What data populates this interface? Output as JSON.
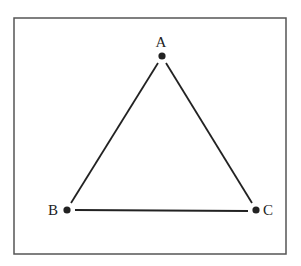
{
  "diagram": {
    "type": "triangle",
    "frame": {
      "x": 14,
      "y": 18,
      "width": 272,
      "height": 236,
      "stroke": "#555555"
    },
    "line_color": "#222222",
    "vertices": [
      {
        "id": "A",
        "label": "A",
        "x": 162,
        "y": 56,
        "label_x": 161,
        "label_y": 47,
        "anchor": "middle"
      },
      {
        "id": "B",
        "label": "B",
        "x": 67,
        "y": 210,
        "label_x": 58,
        "label_y": 215,
        "anchor": "end"
      },
      {
        "id": "C",
        "label": "C",
        "x": 256,
        "y": 210,
        "label_x": 263,
        "label_y": 215,
        "anchor": "start"
      }
    ],
    "edges": [
      {
        "from": "A",
        "to": "B",
        "x1": 158,
        "y1": 63,
        "x2": 71,
        "y2": 203
      },
      {
        "from": "A",
        "to": "C",
        "x1": 166,
        "y1": 63,
        "x2": 252,
        "y2": 203
      },
      {
        "from": "B",
        "to": "C",
        "x1": 75,
        "y1": 210,
        "x2": 248,
        "y2": 211
      }
    ]
  }
}
